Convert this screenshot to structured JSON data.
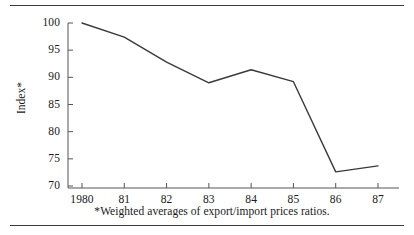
{
  "figure": {
    "footnote": "*Weighted averages of export/import prices ratios.",
    "y_axis_title": "Index*",
    "line_color": "#3a3a3a",
    "axis_color": "#555555",
    "rule_color": "#3b3b3b"
  },
  "chart_data": {
    "type": "line",
    "title": "",
    "subtitle": "",
    "xlabel": "",
    "ylabel": "Index*",
    "x": [
      1980,
      1981,
      1982,
      1983,
      1984,
      1985,
      1986,
      1987
    ],
    "categories": [
      "1980",
      "81",
      "82",
      "83",
      "84",
      "85",
      "86",
      "87"
    ],
    "values": [
      100.0,
      97.4,
      92.8,
      89.0,
      91.4,
      89.2,
      72.6,
      73.7
    ],
    "series": [
      {
        "name": "Index*",
        "values": [
          100.0,
          97.4,
          92.8,
          89.0,
          91.4,
          89.2,
          72.6,
          73.7
        ]
      }
    ],
    "ylim": [
      70,
      100
    ],
    "yticks": [
      70,
      75,
      80,
      85,
      90,
      95,
      100
    ],
    "ytick_labels": [
      "70",
      "75",
      "80",
      "85",
      "90",
      "95",
      "100"
    ],
    "xtick_labels": [
      "1980",
      "81",
      "82",
      "83",
      "84",
      "85",
      "86",
      "87"
    ],
    "grid": false,
    "legend": false,
    "legend_position": "none",
    "annotations": [
      "*Weighted averages of export/import prices ratios."
    ]
  }
}
